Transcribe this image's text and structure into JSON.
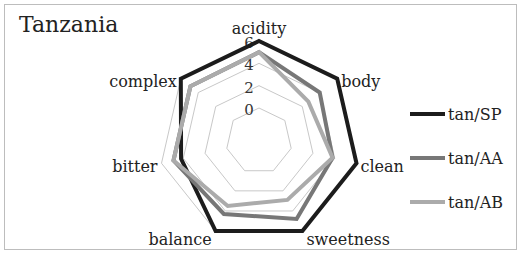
{
  "chart_data": {
    "type": "radar",
    "title": "Tanzania",
    "axes": [
      "acidity",
      "body",
      "clean",
      "sweetness",
      "balance",
      "bitter",
      "complex"
    ],
    "rlim": [
      0,
      6
    ],
    "ticks": [
      "0",
      "2",
      "4",
      "6"
    ],
    "tick_values": [
      0,
      2,
      4,
      6
    ],
    "grid": true,
    "legend_position": "right",
    "series": [
      {
        "name": "tan/SP",
        "color": "#1c1c1c",
        "values": [
          6,
          6,
          6,
          6,
          6,
          4.2,
          6
        ]
      },
      {
        "name": "tan/AA",
        "color": "#777777",
        "values": [
          5,
          4,
          3.8,
          4.8,
          4.3,
          4.9,
          4.9
        ]
      },
      {
        "name": "tan/AB",
        "color": "#ababab",
        "values": [
          5,
          2.7,
          3.8,
          2.9,
          3.5,
          4.9,
          4.9
        ]
      }
    ]
  }
}
